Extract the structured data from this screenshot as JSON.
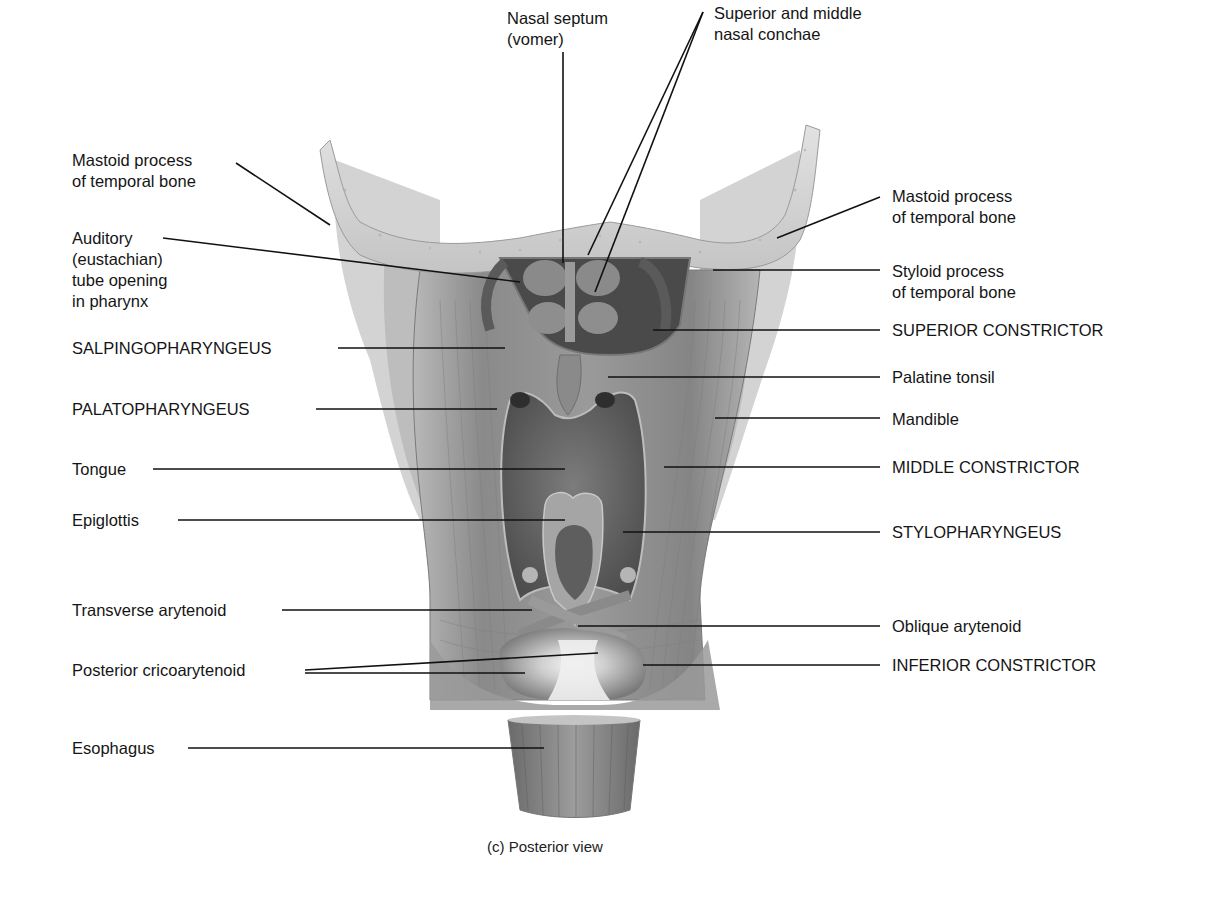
{
  "figure": {
    "caption": "(c) Posterior view"
  },
  "labels": {
    "nasal_septum": "Nasal septum\n(vomer)",
    "nasal_conchae": "Superior and middle\nnasal conchae",
    "mastoid_left": "Mastoid process\nof temporal bone",
    "mastoid_right": "Mastoid process\nof temporal bone",
    "auditory_tube": "Auditory\n(eustachian)\ntube opening\nin pharynx",
    "styloid": "Styloid process\nof temporal bone",
    "salpingopharyngeus": "SALPINGOPHARYNGEUS",
    "superior_constrictor": "SUPERIOR CONSTRICTOR",
    "palatine_tonsil": "Palatine tonsil",
    "palatopharyngeus": "PALATOPHARYNGEUS",
    "mandible": "Mandible",
    "tongue": "Tongue",
    "middle_constrictor": "MIDDLE CONSTRICTOR",
    "epiglottis": "Epiglottis",
    "stylopharyngeus": "STYLOPHARYNGEUS",
    "transverse_arytenoid": "Transverse arytenoid",
    "oblique_arytenoid": "Oblique arytenoid",
    "posterior_cricoarytenoid": "Posterior cricoarytenoid",
    "inferior_constrictor": "INFERIOR CONSTRICTOR",
    "esophagus": "Esophagus"
  },
  "colors": {
    "bone": "#d6d6d6",
    "muscle": "#8f8f8f",
    "muscle_dark": "#6e6e6e",
    "cavity": "#5a5a5a",
    "leader_line": "#111111"
  }
}
